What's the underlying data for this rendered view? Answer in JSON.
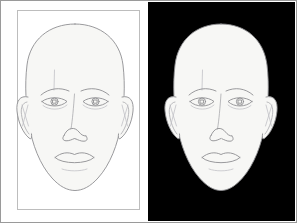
{
  "figure": {
    "title": "Same line-drawn face shown on a white field and on a black field",
    "width": 297,
    "height": 223,
    "frame_color": "#9a9a9a",
    "background_color": "#ffffff"
  },
  "panels": [
    {
      "id": "panel-left",
      "name": "white-background-panel",
      "background_color": "#ffffff",
      "background_label": "white",
      "has_inner_rule": true,
      "inner_rule_color": "#bdbdbd",
      "face": {
        "name": "line-drawn-face",
        "fill_color": "#f7f7f5",
        "outline_color": "#8e8e92",
        "features": [
          "cranium",
          "jaw",
          "chin",
          "left-ear",
          "right-ear",
          "left-eyebrow",
          "right-eyebrow",
          "left-eye",
          "right-eye",
          "left-iris",
          "right-iris",
          "left-pupil",
          "right-pupil",
          "nose-bridge",
          "nose-tip",
          "left-nostril",
          "right-nostril",
          "upper-lip",
          "lower-lip",
          "mouth-line",
          "forehead-crease"
        ]
      }
    },
    {
      "id": "panel-right",
      "name": "black-background-panel",
      "background_color": "#000000",
      "background_label": "black",
      "has_inner_rule": false,
      "inner_rule_color": "#000000",
      "face": {
        "name": "line-drawn-face",
        "fill_color": "#f7f7f5",
        "outline_color": "#8e8e92",
        "features": [
          "cranium",
          "jaw",
          "chin",
          "left-ear",
          "right-ear",
          "left-eyebrow",
          "right-eyebrow",
          "left-eye",
          "right-eye",
          "left-iris",
          "right-iris",
          "left-pupil",
          "right-pupil",
          "nose-bridge",
          "nose-tip",
          "left-nostril",
          "right-nostril",
          "upper-lip",
          "lower-lip",
          "mouth-line",
          "forehead-crease"
        ]
      }
    }
  ]
}
